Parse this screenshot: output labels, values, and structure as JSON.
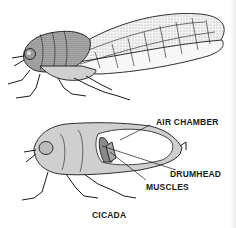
{
  "diagram": {
    "title": "CICADA",
    "labels": {
      "air_chamber": "AIR CHAMBER",
      "drumhead": "DRUMHEAD",
      "muscles": "MUSCLES"
    },
    "colors": {
      "ink": "#1a1a1a",
      "body_fill": "#cfcfcf",
      "chamber_fill": "#ffffff",
      "drumhead_fill": "#8a8a8a",
      "muscle_fill": "#a8a8a8"
    }
  }
}
